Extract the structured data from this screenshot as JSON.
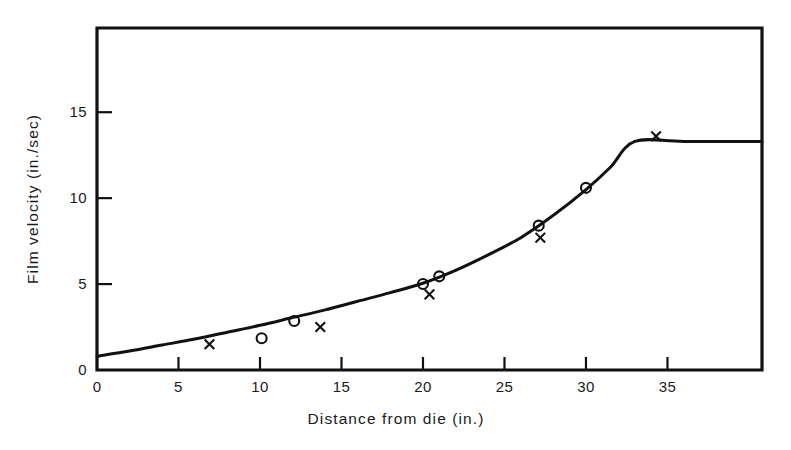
{
  "chart_data": {
    "type": "line",
    "title": "",
    "xlabel": "Distance from die (in.)",
    "ylabel": "Film velocity (in./sec)",
    "xlim": [
      0,
      40.8
    ],
    "ylim": [
      0,
      19.9
    ],
    "xticks": [
      0,
      5,
      10,
      15,
      20,
      25,
      30,
      35
    ],
    "xtick_labels": [
      "0",
      "5",
      "10",
      "15",
      "20",
      "25",
      "30",
      "35"
    ],
    "yticks": [
      0,
      5,
      10,
      15
    ],
    "ytick_labels": [
      "0",
      "5",
      "10",
      "15"
    ],
    "grid": false,
    "legend": "none",
    "frame": "box",
    "line_color": "#111111",
    "marker_color": "#111111",
    "background": "#ffffff",
    "series": [
      {
        "name": "fitted curve",
        "style": "line",
        "x": [
          0,
          2,
          4,
          6,
          8,
          10,
          12,
          14,
          16,
          18,
          20,
          22,
          24,
          26,
          28,
          30,
          31.5,
          33,
          36,
          40.8
        ],
        "y": [
          0.8,
          1.1,
          1.45,
          1.8,
          2.2,
          2.6,
          3.05,
          3.5,
          4.0,
          4.5,
          5.05,
          5.8,
          6.7,
          7.7,
          9.0,
          10.5,
          11.8,
          13.3,
          13.3,
          13.3
        ]
      },
      {
        "name": "circle data points",
        "style": "scatter",
        "marker": "circle",
        "x": [
          10.1,
          12.1,
          20.0,
          21.0,
          27.1,
          30.0
        ],
        "y": [
          1.85,
          2.85,
          5.0,
          5.45,
          8.4,
          10.6
        ]
      },
      {
        "name": "cross data points",
        "style": "scatter",
        "marker": "cross",
        "x": [
          6.9,
          13.7,
          20.4,
          27.2,
          34.3
        ],
        "y": [
          1.5,
          2.5,
          4.4,
          7.7,
          13.6
        ]
      }
    ],
    "annotations": [
      {
        "text": "knee of curve",
        "x": 33,
        "y": 13.3
      }
    ]
  }
}
